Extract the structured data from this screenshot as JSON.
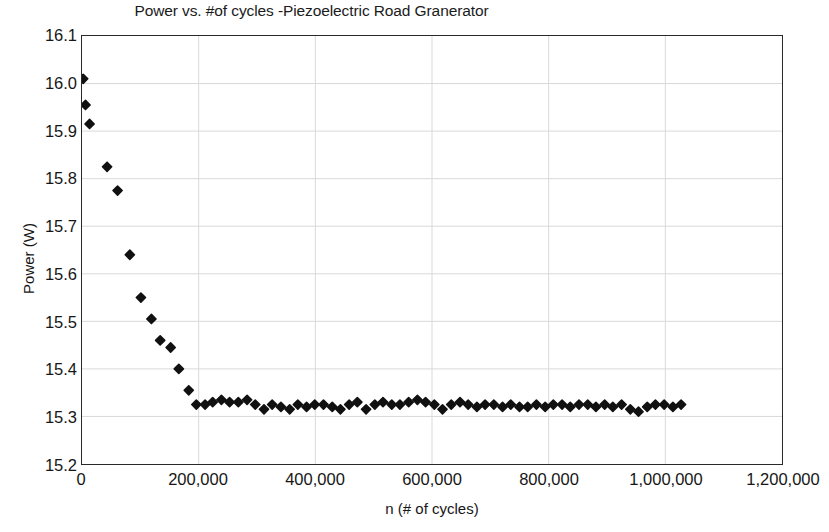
{
  "chart_data": {
    "type": "scatter",
    "title": "Power vs. #of cycles -Piezoelectric Road Granerator",
    "xlabel": "n (# of cycles)",
    "ylabel": "Power (W)",
    "xlim": [
      0,
      1200000
    ],
    "ylim": [
      15.2,
      16.1
    ],
    "xticks": [
      0,
      200000,
      400000,
      600000,
      800000,
      1000000,
      1200000
    ],
    "xtick_labels": [
      "0",
      "200,000",
      "400,000",
      "600,000",
      "800,000",
      "1,000,000",
      "1,200,000"
    ],
    "yticks": [
      15.2,
      15.3,
      15.4,
      15.5,
      15.6,
      15.7,
      15.8,
      15.9,
      16.0,
      16.1
    ],
    "ytick_labels": [
      "15.2",
      "15.3",
      "15.4",
      "15.5",
      "15.6",
      "15.7",
      "15.8",
      "15.9",
      "16.0",
      "16.1"
    ],
    "grid": true,
    "grid_color": "#d9d9d9",
    "legend": null,
    "marker": "diamond",
    "marker_color": "#111111",
    "marker_size": 7,
    "series": [
      {
        "name": "Power",
        "x": [
          2000,
          6000,
          13000,
          43000,
          61000,
          82000,
          101000,
          119000,
          134000,
          152000,
          166000,
          183000,
          196000,
          211000,
          224000,
          239000,
          253000,
          268000,
          283000,
          297000,
          312000,
          326000,
          341000,
          356000,
          370000,
          385000,
          399000,
          414000,
          429000,
          443000,
          458000,
          472000,
          487000,
          502000,
          516000,
          531000,
          545000,
          560000,
          575000,
          589000,
          604000,
          618000,
          633000,
          648000,
          662000,
          677000,
          691000,
          706000,
          721000,
          735000,
          750000,
          764000,
          779000,
          794000,
          808000,
          823000,
          837000,
          852000,
          867000,
          881000,
          896000,
          910000,
          925000,
          940000,
          954000,
          969000,
          983000,
          998000,
          1013000,
          1027000
        ],
        "y": [
          16.01,
          15.955,
          15.915,
          15.825,
          15.775,
          15.64,
          15.55,
          15.505,
          15.46,
          15.445,
          15.4,
          15.355,
          15.325,
          15.325,
          15.33,
          15.335,
          15.33,
          15.33,
          15.335,
          15.325,
          15.315,
          15.325,
          15.32,
          15.315,
          15.325,
          15.32,
          15.325,
          15.325,
          15.32,
          15.315,
          15.325,
          15.33,
          15.315,
          15.325,
          15.33,
          15.325,
          15.325,
          15.33,
          15.335,
          15.33,
          15.325,
          15.315,
          15.325,
          15.33,
          15.325,
          15.32,
          15.325,
          15.325,
          15.32,
          15.325,
          15.32,
          15.32,
          15.325,
          15.32,
          15.325,
          15.325,
          15.32,
          15.325,
          15.325,
          15.32,
          15.325,
          15.32,
          15.325,
          15.315,
          15.31,
          15.32,
          15.325,
          15.325,
          15.32,
          15.325
        ]
      }
    ]
  }
}
